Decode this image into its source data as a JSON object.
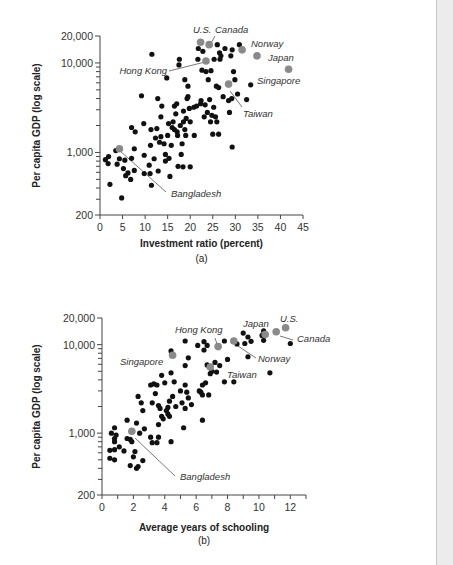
{
  "chart_data": [
    {
      "type": "scatter",
      "id": "a",
      "caption": "(a)",
      "xlabel": "Investment ratio (percent)",
      "ylabel": "Per capita GDP (log scale)",
      "yscale": "log",
      "xlim": [
        0,
        45
      ],
      "ylim": [
        200,
        20000
      ],
      "xticks": [
        0,
        5,
        10,
        15,
        20,
        25,
        30,
        35,
        40,
        45
      ],
      "xtick_labels": [
        "0",
        "5",
        "10",
        "15",
        "20",
        "25",
        "30",
        "35",
        "40",
        "45"
      ],
      "yticks_labeled": [
        200,
        1000,
        10000,
        20000
      ],
      "ytick_labels": [
        "200",
        "1,000",
        "10,000",
        "20,000"
      ],
      "yticks_minor": [
        300,
        400,
        500,
        600,
        700,
        800,
        900,
        2000,
        3000,
        4000,
        5000,
        6000,
        7000,
        8000,
        9000
      ],
      "grid": false,
      "colors": {
        "point": "#111111",
        "highlight": "#8a8a8a"
      },
      "highlighted": [
        {
          "name": "U.S.",
          "x": 22.3,
          "y": 17000
        },
        {
          "name": "Canada",
          "x": 24.2,
          "y": 16000
        },
        {
          "name": "Norway",
          "x": 31.5,
          "y": 14000
        },
        {
          "name": "Japan",
          "x": 34.8,
          "y": 12000
        },
        {
          "name": "Singapore",
          "x": 41.8,
          "y": 8500
        },
        {
          "name": "Hong Kong",
          "x": 23.5,
          "y": 10500
        },
        {
          "name": "Taiwan",
          "x": 28.5,
          "y": 5800
        },
        {
          "name": "Bangladesh",
          "x": 4.3,
          "y": 1100
        }
      ],
      "points": [
        [
          1.2,
          830
        ],
        [
          1.8,
          750
        ],
        [
          1.9,
          900
        ],
        [
          2.2,
          440
        ],
        [
          3.5,
          1050
        ],
        [
          3.8,
          740
        ],
        [
          4.3,
          850
        ],
        [
          4.8,
          310
        ],
        [
          5.2,
          660
        ],
        [
          5.5,
          820
        ],
        [
          5.7,
          550
        ],
        [
          6.2,
          590
        ],
        [
          6.8,
          500
        ],
        [
          7.0,
          860
        ],
        [
          7.0,
          1900
        ],
        [
          7.6,
          1100
        ],
        [
          7.6,
          630
        ],
        [
          7.8,
          1700
        ],
        [
          9.2,
          4300
        ],
        [
          9.7,
          2100
        ],
        [
          9.8,
          930
        ],
        [
          9.8,
          580
        ],
        [
          10.9,
          720
        ],
        [
          11.1,
          580
        ],
        [
          11.2,
          1200
        ],
        [
          11.3,
          1800
        ],
        [
          11.4,
          430
        ],
        [
          11.5,
          12500
        ],
        [
          12.0,
          850
        ],
        [
          12.3,
          1450
        ],
        [
          12.6,
          1850
        ],
        [
          12.8,
          4000
        ],
        [
          12.9,
          620
        ],
        [
          13.2,
          1300
        ],
        [
          13.5,
          1500
        ],
        [
          13.5,
          2500
        ],
        [
          13.7,
          3300
        ],
        [
          14.2,
          1250
        ],
        [
          14.5,
          950
        ],
        [
          14.5,
          800
        ],
        [
          14.8,
          6800
        ],
        [
          15.0,
          1550
        ],
        [
          15.2,
          2100
        ],
        [
          15.3,
          860
        ],
        [
          15.5,
          540
        ],
        [
          15.8,
          1200
        ],
        [
          16.0,
          1900
        ],
        [
          16.2,
          2200
        ],
        [
          16.5,
          1800
        ],
        [
          16.5,
          3300
        ],
        [
          16.8,
          2700
        ],
        [
          17.0,
          3500
        ],
        [
          17.1,
          1700
        ],
        [
          17.2,
          1550
        ],
        [
          17.3,
          700
        ],
        [
          17.5,
          9500
        ],
        [
          17.6,
          11000
        ],
        [
          17.8,
          2000
        ],
        [
          18.0,
          950
        ],
        [
          18.2,
          1250
        ],
        [
          18.4,
          690
        ],
        [
          18.5,
          2900
        ],
        [
          18.5,
          2200
        ],
        [
          18.8,
          6500
        ],
        [
          18.8,
          1800
        ],
        [
          19.0,
          1550
        ],
        [
          19.1,
          2400
        ],
        [
          19.3,
          4000
        ],
        [
          19.5,
          4200
        ],
        [
          19.5,
          5500
        ],
        [
          19.8,
          3100
        ],
        [
          20.0,
          690
        ],
        [
          20.0,
          2200
        ],
        [
          20.8,
          3200
        ],
        [
          20.9,
          1550
        ],
        [
          21.4,
          3300
        ],
        [
          21.7,
          11000
        ],
        [
          21.8,
          14500
        ],
        [
          22.3,
          3500
        ],
        [
          22.4,
          3800
        ],
        [
          22.6,
          8300
        ],
        [
          22.8,
          13500
        ],
        [
          23.1,
          2500
        ],
        [
          23.3,
          3400
        ],
        [
          23.5,
          8000
        ],
        [
          23.8,
          2800
        ],
        [
          24.0,
          6500
        ],
        [
          24.3,
          3900
        ],
        [
          24.5,
          2200
        ],
        [
          24.6,
          8200
        ],
        [
          24.8,
          2600
        ],
        [
          25.0,
          1600
        ],
        [
          25.2,
          3200
        ],
        [
          25.3,
          11000
        ],
        [
          25.6,
          2500
        ],
        [
          25.8,
          5500
        ],
        [
          25.9,
          2200
        ],
        [
          26.0,
          16000
        ],
        [
          26.3,
          5300
        ],
        [
          26.3,
          1600
        ],
        [
          26.5,
          13000
        ],
        [
          26.6,
          11000
        ],
        [
          26.8,
          12000
        ],
        [
          27.3,
          4200
        ],
        [
          27.7,
          14500
        ],
        [
          28.5,
          3800
        ],
        [
          28.7,
          2800
        ],
        [
          29.0,
          12000
        ],
        [
          29.2,
          4000
        ],
        [
          29.3,
          14000
        ],
        [
          29.3,
          1150
        ],
        [
          29.6,
          8000
        ],
        [
          29.9,
          6500
        ],
        [
          30.5,
          4500
        ],
        [
          30.9,
          16000
        ],
        [
          32.5,
          3900
        ],
        [
          33.4,
          5700
        ]
      ],
      "annotations": [
        {
          "text": "U.S.",
          "for": "U.S."
        },
        {
          "text": "Canada",
          "for": "Canada"
        },
        {
          "text": "Norway",
          "for": "Norway"
        },
        {
          "text": "Japan",
          "for": "Japan"
        },
        {
          "text": "Singapore",
          "for": "Singapore"
        },
        {
          "text": "Hong Kong",
          "for": "Hong Kong"
        },
        {
          "text": "Taiwan",
          "for": "Taiwan"
        },
        {
          "text": "Bangladesh",
          "for": "Bangladesh"
        }
      ]
    },
    {
      "type": "scatter",
      "id": "b",
      "caption": "(b)",
      "xlabel": "Average years of schooling",
      "ylabel": "Per capita GDP (log scale)",
      "yscale": "log",
      "xlim": [
        0,
        13
      ],
      "ylim": [
        200,
        20000
      ],
      "xticks": [
        0,
        2,
        4,
        6,
        8,
        10,
        12
      ],
      "xtick_labels": [
        "0",
        "2",
        "4",
        "6",
        "8",
        "10",
        "12"
      ],
      "xticks_minor": [
        1,
        3,
        5,
        7,
        9,
        11,
        13
      ],
      "yticks_labeled": [
        200,
        1000,
        10000,
        20000
      ],
      "ytick_labels": [
        "200",
        "1,000",
        "10,000",
        "20,000"
      ],
      "yticks_minor": [
        300,
        400,
        500,
        600,
        700,
        800,
        900,
        2000,
        3000,
        4000,
        5000,
        6000,
        7000,
        8000,
        9000
      ],
      "grid": false,
      "colors": {
        "point": "#111111",
        "highlight": "#8a8a8a"
      },
      "highlighted": [
        {
          "name": "U.S.",
          "x": 11.7,
          "y": 15500
        },
        {
          "name": "Canada",
          "x": 11.1,
          "y": 14000
        },
        {
          "name": "Japan",
          "x": 10.4,
          "y": 13000
        },
        {
          "name": "Norway",
          "x": 8.4,
          "y": 11000
        },
        {
          "name": "Hong Kong",
          "x": 7.4,
          "y": 9500
        },
        {
          "name": "Singapore",
          "x": 4.5,
          "y": 7600
        },
        {
          "name": "Taiwan",
          "x": 6.9,
          "y": 5600
        },
        {
          "name": "Bangladesh",
          "x": 1.9,
          "y": 1050
        }
      ],
      "points": [
        [
          0.5,
          640
        ],
        [
          0.5,
          520
        ],
        [
          0.6,
          1000
        ],
        [
          0.8,
          1150
        ],
        [
          0.8,
          800
        ],
        [
          0.8,
          870
        ],
        [
          0.8,
          500
        ],
        [
          0.8,
          650
        ],
        [
          0.9,
          950
        ],
        [
          1.1,
          700
        ],
        [
          1.4,
          630
        ],
        [
          1.6,
          870
        ],
        [
          1.6,
          1400
        ],
        [
          1.8,
          850
        ],
        [
          1.8,
          430
        ],
        [
          1.9,
          800
        ],
        [
          2.0,
          540
        ],
        [
          2.1,
          620
        ],
        [
          2.2,
          1300
        ],
        [
          2.2,
          400
        ],
        [
          2.3,
          420
        ],
        [
          2.3,
          2600
        ],
        [
          2.4,
          1000
        ],
        [
          2.5,
          2200
        ],
        [
          2.6,
          490
        ],
        [
          2.6,
          1800
        ],
        [
          2.7,
          1120
        ],
        [
          3.1,
          900
        ],
        [
          3.1,
          3500
        ],
        [
          3.2,
          2200
        ],
        [
          3.2,
          780
        ],
        [
          3.3,
          3600
        ],
        [
          3.4,
          2800
        ],
        [
          3.5,
          780
        ],
        [
          3.5,
          3500
        ],
        [
          3.6,
          900
        ],
        [
          3.6,
          1250
        ],
        [
          3.6,
          2050
        ],
        [
          3.7,
          1900
        ],
        [
          3.8,
          1550
        ],
        [
          3.8,
          4500
        ],
        [
          3.9,
          1450
        ],
        [
          4.0,
          3700
        ],
        [
          4.1,
          1800
        ],
        [
          4.2,
          1950
        ],
        [
          4.2,
          1650
        ],
        [
          4.3,
          2300
        ],
        [
          4.3,
          1550
        ],
        [
          4.4,
          800
        ],
        [
          4.4,
          8500
        ],
        [
          4.4,
          4800
        ],
        [
          4.5,
          2600
        ],
        [
          4.6,
          3800
        ],
        [
          4.7,
          2000
        ],
        [
          5.0,
          3000
        ],
        [
          5.1,
          2200
        ],
        [
          5.2,
          1150
        ],
        [
          5.3,
          11000
        ],
        [
          5.3,
          5800
        ],
        [
          5.3,
          3500
        ],
        [
          5.3,
          1900
        ],
        [
          5.4,
          2900
        ],
        [
          5.5,
          7100
        ],
        [
          5.5,
          2500
        ],
        [
          5.7,
          2100
        ],
        [
          6.1,
          9800
        ],
        [
          6.2,
          3000
        ],
        [
          6.3,
          2900
        ],
        [
          6.4,
          3500
        ],
        [
          6.4,
          1400
        ],
        [
          6.4,
          2700
        ],
        [
          6.5,
          10800
        ],
        [
          6.5,
          8700
        ],
        [
          6.6,
          3700
        ],
        [
          6.7,
          9800
        ],
        [
          6.7,
          5900
        ],
        [
          6.8,
          2700
        ],
        [
          6.9,
          4700
        ],
        [
          7.0,
          5000
        ],
        [
          7.2,
          6300
        ],
        [
          7.3,
          4900
        ],
        [
          7.5,
          5800
        ],
        [
          7.8,
          11000
        ],
        [
          7.8,
          3800
        ],
        [
          8.0,
          6800
        ],
        [
          8.4,
          3800
        ],
        [
          8.6,
          10200
        ],
        [
          9.0,
          13500
        ],
        [
          9.1,
          10300
        ],
        [
          9.3,
          7300
        ],
        [
          9.3,
          12200
        ],
        [
          9.5,
          10900
        ],
        [
          10.2,
          12700
        ],
        [
          10.3,
          11200
        ],
        [
          10.3,
          14300
        ],
        [
          10.7,
          4800
        ],
        [
          12.0,
          10300
        ]
      ],
      "annotations": [
        {
          "text": "U.S.",
          "for": "U.S."
        },
        {
          "text": "Canada",
          "for": "Canada"
        },
        {
          "text": "Japan",
          "for": "Japan"
        },
        {
          "text": "Norway",
          "for": "Norway"
        },
        {
          "text": "Hong Kong",
          "for": "Hong Kong"
        },
        {
          "text": "Singapore",
          "for": "Singapore"
        },
        {
          "text": "Taiwan",
          "for": "Taiwan"
        },
        {
          "text": "Bangladesh",
          "for": "Bangladesh"
        }
      ]
    }
  ]
}
